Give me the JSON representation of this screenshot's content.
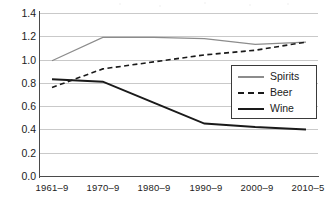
{
  "chart_data": {
    "type": "line",
    "title": "",
    "xlabel": "",
    "ylabel": "",
    "categories": [
      "1961–9",
      "1970–9",
      "1980–9",
      "1990–9",
      "2000–9",
      "2010–5"
    ],
    "ylim": [
      0.0,
      1.4
    ],
    "ytick_labels": [
      "0.0",
      "0.2",
      "0.4",
      "0.6",
      "0.8",
      "1.0",
      "1.2",
      "1.4"
    ],
    "ytick_values": [
      0.0,
      0.2,
      0.4,
      0.6,
      0.8,
      1.0,
      1.2,
      1.4
    ],
    "grid": true,
    "legend_position": "center-right",
    "series": [
      {
        "name": "Spirits",
        "values": [
          0.99,
          1.19,
          1.19,
          1.18,
          1.13,
          1.15
        ],
        "color": "#8c8c8c",
        "style": "solid"
      },
      {
        "name": "Beer",
        "values": [
          0.76,
          0.92,
          0.98,
          1.04,
          1.08,
          1.15
        ],
        "color": "#1a1a1a",
        "style": "dashed"
      },
      {
        "name": "Wine",
        "values": [
          0.83,
          0.81,
          0.63,
          0.45,
          0.42,
          0.4
        ],
        "color": "#1a1a1a",
        "style": "solid"
      }
    ]
  },
  "legend": {
    "items": [
      {
        "label": "Spirits"
      },
      {
        "label": "Beer"
      },
      {
        "label": "Wine"
      }
    ]
  }
}
